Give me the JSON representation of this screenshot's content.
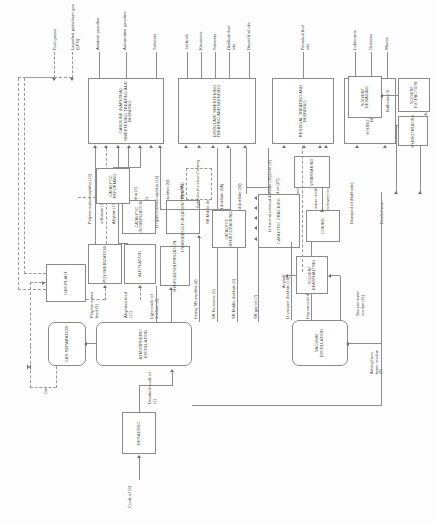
{
  "diagram": {
    "feed": "Crude oil (0)",
    "gas_label": "Gas",
    "asphalt_label": "Asphalt"
  },
  "products": [
    {
      "id": "fuel-gases",
      "label": "Fuel gases"
    },
    {
      "id": "lpg",
      "label": "Liquefied petroleum gas (LPG)"
    },
    {
      "id": "aviation-gasoline",
      "label": "Aviation gasoline"
    },
    {
      "id": "automotive-gasoline",
      "label": "Automotive gasoline"
    },
    {
      "id": "solvents-gasoline",
      "label": "Solvents"
    },
    {
      "id": "jet-fuels",
      "label": "Jet fuels"
    },
    {
      "id": "kerosene",
      "label": "Kerosene"
    },
    {
      "id": "solvents-distillate",
      "label": "Solvents"
    },
    {
      "id": "distillate-fuel-oils",
      "label": "Distillate fuel oils"
    },
    {
      "id": "diesel-fuel-oils",
      "label": "Diesel fuel oils"
    },
    {
      "id": "residual-fuel-oils",
      "label": "Residual fuel oils"
    },
    {
      "id": "lubricants",
      "label": "Lubricants"
    },
    {
      "id": "greases",
      "label": "Greases"
    },
    {
      "id": "waxes",
      "label": "Waxes"
    }
  ],
  "units": [
    {
      "id": "desalting",
      "label": "DESALTING"
    },
    {
      "id": "atmospheric-distillation",
      "label": "ATMOSPHERIC DISTILLATION"
    },
    {
      "id": "vacuum-distillation",
      "label": "VACUUM DISTILLATION"
    },
    {
      "id": "gas-separation",
      "label": "GAS SEPARATION"
    },
    {
      "id": "gas-plant",
      "label": "GAS PLANT"
    },
    {
      "id": "polymerization",
      "label": "POLYMERIZATION"
    },
    {
      "id": "alkylation",
      "label": "ALKYLATION"
    },
    {
      "id": "hydrodesulfurization",
      "label": "HYDRODESULFURIZATION"
    },
    {
      "id": "catalytic-isomerization",
      "label": "CATALYTIC ISOMERIZATION"
    },
    {
      "id": "hydrodesulfurization-treating",
      "label": "HYDRODESULFURIZATION/TREATING"
    },
    {
      "id": "catalytic-reforming",
      "label": "CATALYTIC REFORMING"
    },
    {
      "id": "catalytic-hydrocracking",
      "label": "CATALYTIC HYDROCRACKING"
    },
    {
      "id": "hydrodesulfurization-treating-2",
      "label": "Hydrodesulfurization/Treating"
    },
    {
      "id": "catalytic-cracking",
      "label": "CATALYTIC CRACKING"
    },
    {
      "id": "visbreaking",
      "label": "VISBREAKING"
    },
    {
      "id": "coking",
      "label": "COKING"
    },
    {
      "id": "solvent-deasphalting",
      "label": "SOLVENT DEASPHALTING"
    },
    {
      "id": "solvent-extraction",
      "label": "SOLVENT EXTRACTION"
    },
    {
      "id": "hydrotreating",
      "label": "HYDROTREATING"
    },
    {
      "id": "solvent-dewaxing",
      "label": "SOLVENT DEWAXING"
    },
    {
      "id": "gasoline-blending",
      "label": "GASOLINE (NAPHTHA) SWEETENING TREATING AND BLENDING"
    },
    {
      "id": "distillate-blending",
      "label": "DISTILLATE SWEETENING TREATING AND BLENDING"
    },
    {
      "id": "residual-blending",
      "label": "RESIDUAL TREATING AND BLENDING"
    },
    {
      "id": "hydro-blending",
      "label": "HYDRO-TREATING AND BLENDING"
    }
  ],
  "streams": [
    {
      "id": "desalted-crude",
      "label": "Desalted crude oil (1)"
    },
    {
      "id": "light-crude-distillate",
      "label": "Light crude oil distillate (2)"
    },
    {
      "id": "lt-sr-naphtha",
      "label": "Light SR naphtha (3)"
    },
    {
      "id": "hvy-sr-naphtha",
      "label": "Heavy SR naphtha (4)"
    },
    {
      "id": "sr-kerosene",
      "label": "SR Kerosene (5)"
    },
    {
      "id": "sr-middle-distillate",
      "label": "SR Middle distillate (6)"
    },
    {
      "id": "sr-gas-oil",
      "label": "SR gas oil (7)"
    },
    {
      "id": "atmospheric-tower-residue",
      "label": "Atmospheric tower residue (8)"
    },
    {
      "id": "polymerization-feed",
      "label": "Polymerization feed (9)"
    },
    {
      "id": "polymerization-naphtha",
      "label": "Polymerization naphtha (10)"
    },
    {
      "id": "alkylation-feed",
      "label": "Alkylation feed (11)"
    },
    {
      "id": "n-butane",
      "label": "n-Butane (12)"
    },
    {
      "id": "alkylate",
      "label": "Alkylate (13)"
    },
    {
      "id": "isonaphtha",
      "label": "Isonaphtha (14)"
    },
    {
      "id": "reformate",
      "label": "Reformate (15)"
    },
    {
      "id": "lt-hydrocracked-naphtha",
      "label": "Lt hydrocracked naphtha (16)"
    },
    {
      "id": "lt-vacuum-distillate",
      "label": "Lt vacuum distillate (19)"
    },
    {
      "id": "hvy-vacuum-distillate",
      "label": "Hvy vacuum distillate (20)"
    },
    {
      "id": "lube-feedstock",
      "label": "Lube feedstock (20)"
    },
    {
      "id": "vacuum-tower-residue",
      "label": "Vacuum tower residue (21)"
    },
    {
      "id": "lt-cat-cracked-naphtha",
      "label": "Lt cat cracked naphtha (22)"
    },
    {
      "id": "lt-cat-cracked-distillate",
      "label": "Lt cat cracked distillate (24)"
    },
    {
      "id": "hvy-cat-cracked-distillate",
      "label": "Hvy cat cracked distillate (26)"
    },
    {
      "id": "cat-cracked-clarified-oil",
      "label": "Cat cracked clarified oil (27)"
    },
    {
      "id": "lt-thermal-cracked-distillate",
      "label": "Lt thermal cracked distillate (30)(Gas oil)"
    },
    {
      "id": "thermally-cracked-residue",
      "label": "Thermally cracked residue (31)"
    },
    {
      "id": "hds-hvy-naphtha",
      "label": "HDS hvy naphtha (4A)"
    },
    {
      "id": "hds-mid-distillate",
      "label": "HDS mid distillate (6A)"
    },
    {
      "id": "raffinate",
      "label": "Raffinate (3)"
    },
    {
      "id": "dewaxed-oil",
      "label": "Dewaxed oil (Raffinate)"
    },
    {
      "id": "deoiled-wax",
      "label": "Deoiled wax"
    }
  ]
}
